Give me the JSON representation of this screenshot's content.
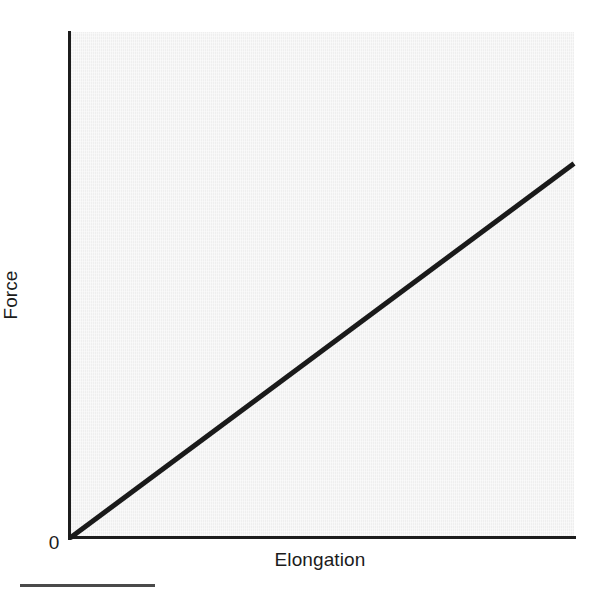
{
  "figure": {
    "background_color": "#ffffff",
    "plot_fill_color": "#efefef",
    "axis_color": "#1c1c1c",
    "line_color": "#1a1a1a"
  },
  "labels": {
    "y_axis": "Force",
    "x_axis": "Elongation",
    "origin": "0"
  },
  "chart_data": {
    "type": "line",
    "title": "",
    "subtitle": "",
    "xlabel": "Elongation",
    "ylabel": "Force",
    "xlim": [
      0,
      1
    ],
    "ylim": [
      0,
      1
    ],
    "grid": false,
    "legend": false,
    "legend_position": "none",
    "xticks": [
      0
    ],
    "xticklabels": [
      "0"
    ],
    "yticks": [],
    "yticklabels": [],
    "annotations": [
      {
        "text": "0",
        "x": 0,
        "y": 0,
        "position": "origin"
      }
    ],
    "series": [
      {
        "name": "Linear elastic response",
        "line_color": "#1a1a1a",
        "line_width": 5,
        "x": [
          0.0,
          1.0
        ],
        "values": [
          0.0,
          0.74
        ],
        "points": [
          {
            "x": 0.0,
            "y": 0.0
          },
          {
            "x": 1.0,
            "y": 0.74
          }
        ]
      }
    ]
  }
}
